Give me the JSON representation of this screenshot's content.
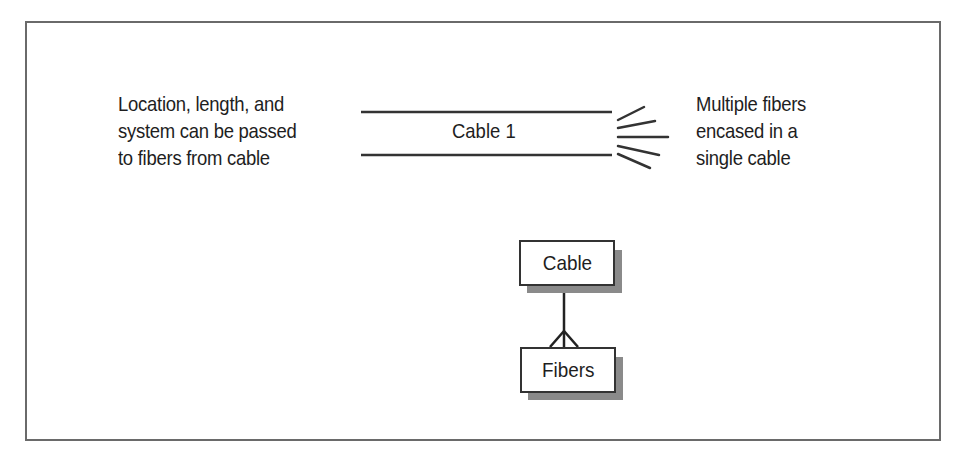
{
  "diagram": {
    "left_note": {
      "lines": [
        "Location, length, and",
        "system can be passed",
        "to fibers from cable"
      ]
    },
    "cable_label": "Cable 1",
    "right_note": {
      "lines": [
        "Multiple fibers",
        "encased in a",
        "single cable"
      ]
    },
    "entities": {
      "parent": "Cable",
      "child": "Fibers"
    },
    "relationship": "one-to-many (crow's foot)",
    "colors": {
      "line": "#333333",
      "frame": "#6a6a6a",
      "shadow": "#8a8a8a"
    }
  }
}
